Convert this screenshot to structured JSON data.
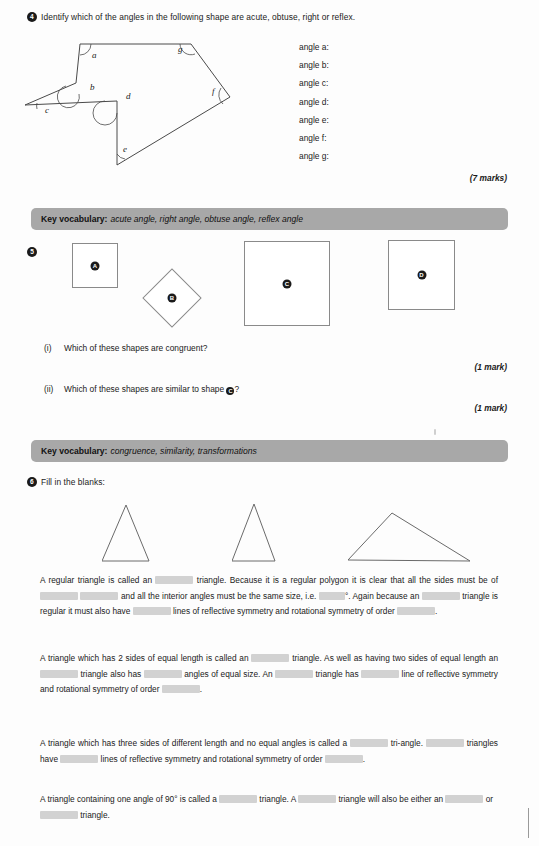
{
  "page": {
    "background": "#fdfdfd",
    "vocab_bar_color": "#a8a8a8",
    "blank_color": "#d2d2d2",
    "ink_color": "#1a1a1a"
  },
  "q4": {
    "number": "4",
    "prompt": "Identify which of the angles in the following shape are acute, obtuse, right or reflex.",
    "diagram": {
      "name": "irregular-heptagon-with-labelled-angles",
      "vertex_labels": [
        "a",
        "b",
        "c",
        "d",
        "e",
        "f",
        "g"
      ],
      "vertices": {
        "a": [
          80,
          44
        ],
        "g": [
          191,
          44
        ],
        "f": [
          230,
          97
        ],
        "e": [
          117,
          165
        ],
        "d": [
          117,
          101
        ],
        "c": [
          25,
          105
        ],
        "b": [
          76,
          83
        ]
      },
      "path_order": [
        "a",
        "g",
        "f",
        "e",
        "d",
        "c",
        "b"
      ]
    },
    "answers": [
      "angle a:",
      "angle b:",
      "angle c:",
      "angle d:",
      "angle e:",
      "angle f:",
      "angle g:"
    ],
    "marks": "(7 marks)"
  },
  "vocab1": {
    "label": "Key vocabulary:",
    "terms": "acute angle, right angle, obtuse angle, reflex angle"
  },
  "q5": {
    "number": "5",
    "shapes": [
      {
        "letter": "A",
        "type": "square",
        "x": 72,
        "y": 243,
        "w": 46,
        "h": 45,
        "rotated": false
      },
      {
        "letter": "B",
        "type": "square",
        "x": 151,
        "y": 277,
        "w": 42,
        "h": 42,
        "rotated": true
      },
      {
        "letter": "C",
        "type": "square",
        "x": 244,
        "y": 241,
        "w": 86,
        "h": 85,
        "rotated": false
      },
      {
        "letter": "D",
        "type": "square",
        "x": 388,
        "y": 240,
        "w": 67,
        "h": 70,
        "rotated": false
      }
    ],
    "parts": [
      {
        "numeral": "(i)",
        "text": "Which of these shapes are congruent?",
        "marks": "(1 mark)"
      },
      {
        "numeral": "(ii)",
        "text_before": "Which of these shapes are similar to shape ",
        "badge": "C",
        "text_after": "?",
        "marks": "(1 mark)"
      }
    ]
  },
  "vocab2": {
    "label": "Key vocabulary:",
    "terms": "congruence, similarity, transformations"
  },
  "q6": {
    "number": "6",
    "prompt": "Fill in the blanks:",
    "triangles": [
      {
        "name": "equilateral-triangle",
        "points": "47,58 0,58 24,2"
      },
      {
        "name": "isosceles-triangle",
        "points": "43,58 0,58 22,1"
      },
      {
        "name": "scalene-triangle",
        "points": "0,57 122,58 44,10"
      }
    ],
    "paragraphs": [
      {
        "id": "equilateral-paragraph",
        "segments": [
          {
            "t": "text",
            "v": "A regular triangle is called an "
          },
          {
            "t": "blank",
            "size": "m"
          },
          {
            "t": "text",
            "v": " triangle. Because it is a regular polygon it is clear that all the sides must be of "
          },
          {
            "t": "blank",
            "size": "m"
          },
          {
            "t": "text",
            "v": " "
          },
          {
            "t": "blank",
            "size": "m"
          },
          {
            "t": "text",
            "v": " and all the interior angles must be the same size, i.e. "
          },
          {
            "t": "blank",
            "size": "s"
          },
          {
            "t": "text",
            "v": "°. Again because an "
          },
          {
            "t": "blank",
            "size": "m"
          },
          {
            "t": "text",
            "v": " triangle is regular it must also have "
          },
          {
            "t": "blank",
            "size": "m"
          },
          {
            "t": "text",
            "v": " lines of reflective symmetry and rotational symmetry of order "
          },
          {
            "t": "blank",
            "size": "m"
          },
          {
            "t": "text",
            "v": "."
          }
        ]
      },
      {
        "id": "isosceles-paragraph",
        "segments": [
          {
            "t": "text",
            "v": "A triangle which has 2 sides of equal length is called an "
          },
          {
            "t": "blank",
            "size": "m"
          },
          {
            "t": "text",
            "v": " triangle. As well as having two sides of equal length an "
          },
          {
            "t": "blank",
            "size": "m"
          },
          {
            "t": "text",
            "v": " triangle also has "
          },
          {
            "t": "blank",
            "size": "m"
          },
          {
            "t": "text",
            "v": " angles of equal size. An "
          },
          {
            "t": "blank",
            "size": "m"
          },
          {
            "t": "text",
            "v": " triangle has "
          },
          {
            "t": "blank",
            "size": "m"
          },
          {
            "t": "text",
            "v": " line of reflective symmetry and rotational symmetry of order "
          },
          {
            "t": "blank",
            "size": "m"
          },
          {
            "t": "text",
            "v": "."
          }
        ]
      },
      {
        "id": "scalene-paragraph",
        "segments": [
          {
            "t": "text",
            "v": "A triangle which has three sides of different length and no equal angles is called a "
          },
          {
            "t": "blank",
            "size": "m"
          },
          {
            "t": "text",
            "v": " tri-angle. "
          },
          {
            "t": "blank",
            "size": "m"
          },
          {
            "t": "text",
            "v": " triangles have "
          },
          {
            "t": "blank",
            "size": "m"
          },
          {
            "t": "text",
            "v": " lines of reflective symmetry and rotational symmetry of order "
          },
          {
            "t": "blank",
            "size": "m"
          },
          {
            "t": "text",
            "v": "."
          }
        ]
      },
      {
        "id": "right-angled-paragraph",
        "segments": [
          {
            "t": "text",
            "v": "A triangle containing one angle of 90° is called a "
          },
          {
            "t": "blank",
            "size": "m"
          },
          {
            "t": "text",
            "v": " triangle. A "
          },
          {
            "t": "blank",
            "size": "m"
          },
          {
            "t": "text",
            "v": " triangle will also be either an "
          },
          {
            "t": "blank",
            "size": "m"
          },
          {
            "t": "text",
            "v": " or "
          },
          {
            "t": "blank",
            "size": "m"
          },
          {
            "t": "text",
            "v": " triangle."
          }
        ]
      }
    ]
  }
}
